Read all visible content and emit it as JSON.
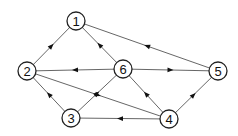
{
  "diagram": {
    "type": "directed-graph",
    "colors": {
      "stroke": "#222222",
      "edge": "#555555",
      "node_fill": "#ffffff",
      "arrow": "#111111"
    },
    "node_radius": 9,
    "nodes": [
      {
        "id": "1",
        "label": "1",
        "x": 76,
        "y": 21
      },
      {
        "id": "2",
        "label": "2",
        "x": 27,
        "y": 71
      },
      {
        "id": "3",
        "label": "3",
        "x": 71,
        "y": 118
      },
      {
        "id": "4",
        "label": "4",
        "x": 169,
        "y": 119
      },
      {
        "id": "5",
        "label": "5",
        "x": 218,
        "y": 71
      },
      {
        "id": "6",
        "label": "6",
        "x": 123,
        "y": 69
      }
    ],
    "edges": [
      {
        "from": "2",
        "to": "1"
      },
      {
        "from": "6",
        "to": "1"
      },
      {
        "from": "5",
        "to": "1"
      },
      {
        "from": "6",
        "to": "2"
      },
      {
        "from": "6",
        "to": "5"
      },
      {
        "from": "3",
        "to": "2"
      },
      {
        "from": "2",
        "to": "4"
      },
      {
        "from": "3",
        "to": "6"
      },
      {
        "from": "4",
        "to": "6"
      },
      {
        "from": "4",
        "to": "3"
      },
      {
        "from": "4",
        "to": "5"
      }
    ]
  }
}
